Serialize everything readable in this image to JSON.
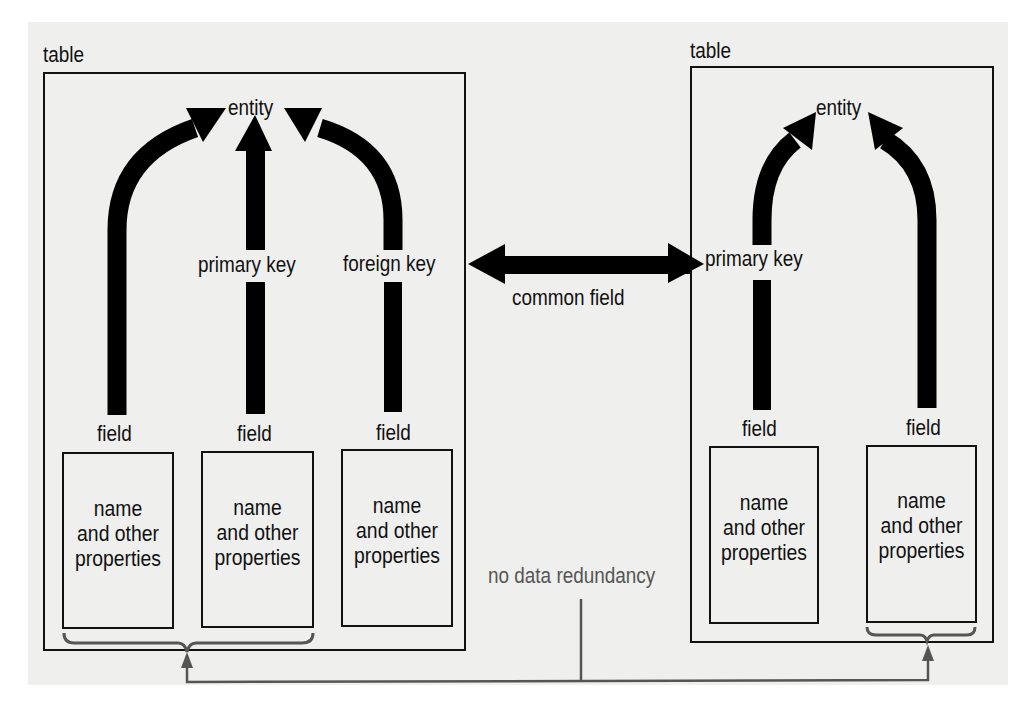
{
  "diagram": {
    "left_table": {
      "title": "table",
      "entity": "entity",
      "primary_key_label": "primary key",
      "foreign_key_label": "foreign key",
      "fields": [
        {
          "label": "field",
          "properties": [
            "name",
            "and other",
            "properties"
          ]
        },
        {
          "label": "field",
          "properties": [
            "name",
            "and other",
            "properties"
          ]
        },
        {
          "label": "field",
          "properties": [
            "name",
            "and other",
            "properties"
          ]
        }
      ]
    },
    "right_table": {
      "title": "table",
      "entity": "entity",
      "primary_key_label": "primary key",
      "fields": [
        {
          "label": "field",
          "properties": [
            "name",
            "and other",
            "properties"
          ]
        },
        {
          "label": "field",
          "properties": [
            "name",
            "and other",
            "properties"
          ]
        }
      ]
    },
    "connector": {
      "common_field_label": "common field",
      "no_redundancy_label": "no data redundancy"
    }
  }
}
